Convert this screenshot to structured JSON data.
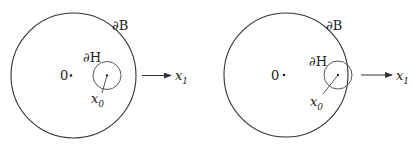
{
  "panels": [
    {
      "id": "left",
      "outer_label": "∂B",
      "inner_label": "∂H",
      "origin_label": "0",
      "point_label": "x",
      "point_sub": "0",
      "axis_label": "x",
      "axis_sub": "1",
      "outer": {
        "cx": 73.5,
        "cy": 75.5,
        "r": 62.5
      },
      "inner": {
        "cx": 107,
        "cy": 75.5,
        "r": 14
      },
      "origin_dot": {
        "x": 71,
        "y": 75.5
      },
      "origin_text": {
        "x": 60,
        "y": 80
      },
      "radius_line": {
        "x1": 107,
        "y1": 75.5,
        "x2": 102,
        "y2": 93
      },
      "outer_label_pos": {
        "x": 112,
        "y": 30
      },
      "inner_label_pos": {
        "x": 83,
        "y": 62
      },
      "point_label_pos": {
        "x": 91,
        "y": 103
      },
      "arrow": {
        "x1": 142,
        "x2": 171,
        "y": 75.5
      },
      "axis_label_pos": {
        "x": 175,
        "y": 80
      }
    },
    {
      "id": "right",
      "outer_label": "∂B",
      "inner_label": "∂H",
      "origin_label": "0",
      "point_label": "x",
      "point_sub": "0",
      "axis_label": "x",
      "axis_sub": "1",
      "outer": {
        "cx": 286,
        "cy": 75,
        "r": 62
      },
      "inner": {
        "cx": 338,
        "cy": 75,
        "r": 14
      },
      "origin_dot": {
        "x": 284,
        "y": 75
      },
      "origin_text": {
        "x": 271,
        "y": 80
      },
      "radius_line": {
        "x1": 338,
        "y1": 75,
        "x2": 323,
        "y2": 94
      },
      "outer_label_pos": {
        "x": 326,
        "y": 30
      },
      "inner_label_pos": {
        "x": 309,
        "y": 66
      },
      "point_label_pos": {
        "x": 310,
        "y": 106
      },
      "arrow": {
        "x1": 361,
        "x2": 392,
        "y": 75
      },
      "axis_label_pos": {
        "x": 396,
        "y": 80
      }
    }
  ],
  "colors": {
    "stroke": "#333333",
    "text": "#222222",
    "background": "#ffffff"
  }
}
